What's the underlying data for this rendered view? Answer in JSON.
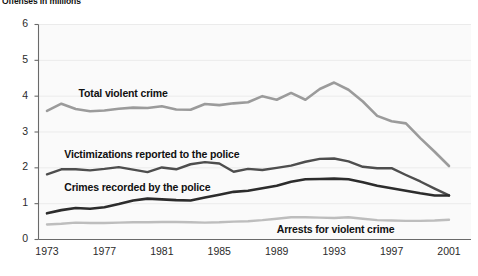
{
  "chart_title": "Offenses in millions",
  "chart_data": {
    "type": "line",
    "title": "Offenses in millions",
    "xlabel": "",
    "ylabel": "Offenses in millions",
    "xlim": [
      1973,
      2001
    ],
    "ylim": [
      0,
      6
    ],
    "grid": true,
    "legend_position": "inline-annotations",
    "x": [
      1973,
      1974,
      1975,
      1976,
      1977,
      1978,
      1979,
      1980,
      1981,
      1982,
      1983,
      1984,
      1985,
      1986,
      1987,
      1988,
      1989,
      1990,
      1991,
      1992,
      1993,
      1994,
      1995,
      1996,
      1997,
      1998,
      1999,
      2000,
      2001
    ],
    "x_ticks": [
      1973,
      1977,
      1981,
      1985,
      1989,
      1993,
      1997,
      2001
    ],
    "y_ticks": [
      0,
      1,
      2,
      3,
      4,
      5,
      6
    ],
    "series": [
      {
        "name": "Total violent crime",
        "color": "#9b9b9b",
        "width": 2.6,
        "values": [
          3.59,
          3.79,
          3.64,
          3.58,
          3.6,
          3.65,
          3.68,
          3.67,
          3.72,
          3.63,
          3.62,
          3.78,
          3.75,
          3.8,
          3.83,
          4.0,
          3.9,
          4.09,
          3.9,
          4.2,
          4.38,
          4.18,
          3.85,
          3.45,
          3.3,
          3.24,
          2.83,
          2.45,
          2.05
        ]
      },
      {
        "name": "Victimizations reported to the police",
        "color": "#4e4e4e",
        "width": 2.4,
        "values": [
          1.82,
          1.96,
          1.96,
          1.93,
          1.97,
          2.02,
          1.95,
          1.88,
          2.01,
          1.96,
          2.1,
          2.16,
          2.12,
          1.89,
          1.97,
          1.94,
          2.0,
          2.06,
          2.17,
          2.25,
          2.26,
          2.18,
          2.03,
          1.99,
          1.99,
          1.8,
          1.62,
          1.42,
          1.23
        ]
      },
      {
        "name": "Crimes recorded by the police",
        "color": "#2c2c2c",
        "width": 2.6,
        "values": [
          0.73,
          0.82,
          0.88,
          0.86,
          0.9,
          0.99,
          1.09,
          1.14,
          1.12,
          1.1,
          1.09,
          1.17,
          1.25,
          1.33,
          1.36,
          1.43,
          1.5,
          1.61,
          1.68,
          1.69,
          1.7,
          1.68,
          1.6,
          1.5,
          1.43,
          1.36,
          1.29,
          1.23,
          1.23
        ]
      },
      {
        "name": "Arrests for violent crime",
        "color": "#bdbdbd",
        "width": 2.4,
        "values": [
          0.42,
          0.44,
          0.47,
          0.46,
          0.46,
          0.47,
          0.48,
          0.48,
          0.49,
          0.49,
          0.48,
          0.47,
          0.48,
          0.5,
          0.51,
          0.54,
          0.58,
          0.62,
          0.62,
          0.61,
          0.6,
          0.62,
          0.58,
          0.54,
          0.53,
          0.52,
          0.52,
          0.53,
          0.55
        ]
      }
    ],
    "annotations": [
      {
        "text": "Total violent crime",
        "x": 1975.2,
        "y": 4.05
      },
      {
        "text": "Victimizations reported to the police",
        "x": 1974.2,
        "y": 2.35
      },
      {
        "text": "Crimes recorded by the police",
        "x": 1974.2,
        "y": 1.45
      },
      {
        "text": "Arrests for violent crime",
        "x": 1989.0,
        "y": 0.26
      }
    ]
  },
  "axis": {
    "y_labels": [
      "6",
      "5",
      "4",
      "3",
      "2",
      "1",
      "0"
    ],
    "x_labels": [
      "1973",
      "1977",
      "1981",
      "1985",
      "1989",
      "1993",
      "1997",
      "2001"
    ]
  },
  "colors": {
    "total_violent_crime": "#9b9b9b",
    "victimizations_reported": "#4e4e4e",
    "crimes_recorded": "#2c2c2c",
    "arrests": "#bdbdbd",
    "plot_background": "#fafafa",
    "gridline": "#ebebeb",
    "axis": "#6a6a6a"
  }
}
